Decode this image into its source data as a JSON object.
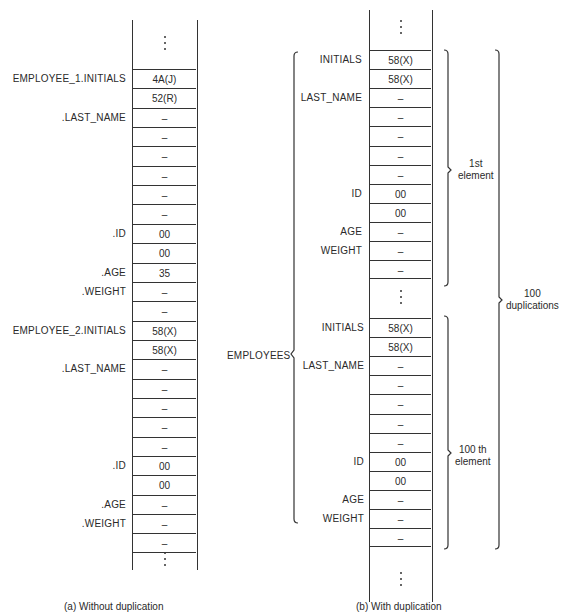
{
  "panel_a": {
    "caption": "(a)  Without duplication",
    "cells": [
      {
        "value": "4A(J)",
        "label": "EMPLOYEE_1.INITIALS"
      },
      {
        "value": "52(R)",
        "label": ""
      },
      {
        "value": "–",
        "label": ".LAST_NAME"
      },
      {
        "value": "–",
        "label": ""
      },
      {
        "value": "–",
        "label": ""
      },
      {
        "value": "–",
        "label": ""
      },
      {
        "value": "–",
        "label": ""
      },
      {
        "value": "–",
        "label": ""
      },
      {
        "value": "00",
        "label": ".ID"
      },
      {
        "value": "00",
        "label": ""
      },
      {
        "value": "35",
        "label": ".AGE"
      },
      {
        "value": "–",
        "label": ".WEIGHT"
      },
      {
        "value": "–",
        "label": ""
      },
      {
        "value": "58(X)",
        "label": "EMPLOYEE_2.INITIALS"
      },
      {
        "value": "58(X)",
        "label": ""
      },
      {
        "value": "–",
        "label": ".LAST_NAME"
      },
      {
        "value": "–",
        "label": ""
      },
      {
        "value": "–",
        "label": ""
      },
      {
        "value": "–",
        "label": ""
      },
      {
        "value": "–",
        "label": ""
      },
      {
        "value": "00",
        "label": ".ID"
      },
      {
        "value": "00",
        "label": ""
      },
      {
        "value": "–",
        "label": ".AGE"
      },
      {
        "value": "–",
        "label": ".WEIGHT"
      },
      {
        "value": "–",
        "label": ""
      }
    ]
  },
  "panel_b": {
    "caption": "(b)  With duplication",
    "group_label": "EMPLOYEES",
    "first_element": {
      "brace_label_line1": "1st",
      "brace_label_line2": "element",
      "cells": [
        {
          "value": "58(X)",
          "label": "INITIALS"
        },
        {
          "value": "58(X)",
          "label": ""
        },
        {
          "value": "–",
          "label": "LAST_NAME"
        },
        {
          "value": "–",
          "label": ""
        },
        {
          "value": "–",
          "label": ""
        },
        {
          "value": "–",
          "label": ""
        },
        {
          "value": "–",
          "label": ""
        },
        {
          "value": "00",
          "label": "ID"
        },
        {
          "value": "00",
          "label": ""
        },
        {
          "value": "–",
          "label": "AGE"
        },
        {
          "value": "–",
          "label": "WEIGHT"
        },
        {
          "value": "–",
          "label": ""
        }
      ]
    },
    "last_element": {
      "brace_label_line1": "100 th",
      "brace_label_line2": "element",
      "cells": [
        {
          "value": "58(X)",
          "label": "INITIALS"
        },
        {
          "value": "58(X)",
          "label": ""
        },
        {
          "value": "–",
          "label": "LAST_NAME"
        },
        {
          "value": "–",
          "label": ""
        },
        {
          "value": "–",
          "label": ""
        },
        {
          "value": "–",
          "label": ""
        },
        {
          "value": "–",
          "label": ""
        },
        {
          "value": "00",
          "label": "ID"
        },
        {
          "value": "00",
          "label": ""
        },
        {
          "value": "–",
          "label": "AGE"
        },
        {
          "value": "–",
          "label": "WEIGHT"
        },
        {
          "value": "–",
          "label": ""
        }
      ]
    },
    "outer_brace_label_line1": "100",
    "outer_brace_label_line2": "duplications"
  }
}
